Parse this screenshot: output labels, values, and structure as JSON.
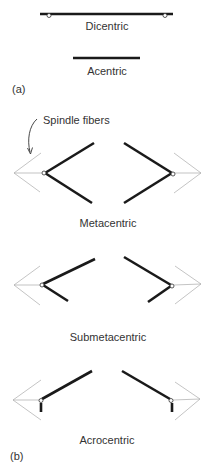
{
  "part_a": {
    "panel_label": "(a)",
    "dicentric_label": "Dicentric",
    "acentric_label": "Acentric"
  },
  "part_b": {
    "panel_label": "(b)",
    "spindle_label": "Spindle fibers",
    "metacentric_label": "Metacentric",
    "submetacentric_label": "Submetacentric",
    "acrocentric_label": "Acrocentric"
  },
  "colors": {
    "chromosome": "#1a1a1a",
    "spindle": "#9a9a9a",
    "text": "#333333",
    "background": "#ffffff"
  }
}
